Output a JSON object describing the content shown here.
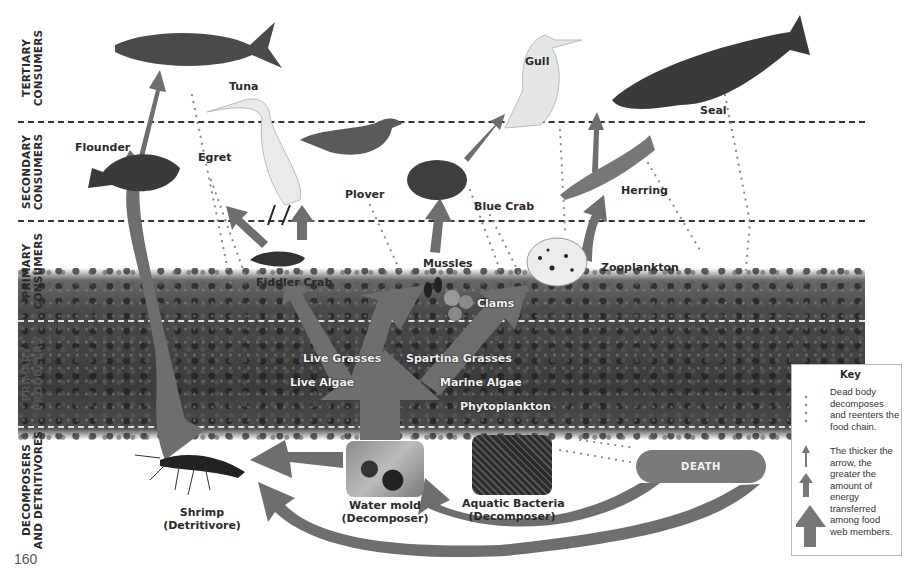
{
  "page_number": "160",
  "bands": [
    {
      "id": "tertiary",
      "label": "TERTIARY\nCONSUMERS"
    },
    {
      "id": "secondary",
      "label": "SECONDARY\nCONSUMERS"
    },
    {
      "id": "primary_consumers",
      "label": "PRIMARY\nCONSUMERS"
    },
    {
      "id": "primary_producers",
      "label": "PRIMARY\nPRODUCERS"
    },
    {
      "id": "decomposers",
      "label": "DECOMPOSERS\nAND DETRITIVORES"
    }
  ],
  "organisms": {
    "tuna": "Tuna",
    "gull": "Gull",
    "seal": "Seal",
    "flounder": "Flounder",
    "egret": "Egret",
    "plover": "Plover",
    "blue_crab": "Blue Crab",
    "herring": "Herring",
    "fiddler_crab": "Fiddler Crab",
    "mussles": "Mussles",
    "clams": "Clams",
    "zooplankton": "Zooplankton",
    "live_grasses": "Live Grasses",
    "spartina_grasses": "Spartina Grasses",
    "live_algae": "Live Algae",
    "marine_algae": "Marine Algae",
    "phytoplankton": "Phytoplankton",
    "shrimp": "Shrimp",
    "shrimp_role": "(Detritivore)",
    "water_mold": "Water mold",
    "water_mold_role": "(Decomposer)",
    "aquatic_bacteria": "Aquatic Bacteria",
    "aquatic_bacteria_role": "(Decomposer)"
  },
  "death_label": "DEATH",
  "key": {
    "title": "Key",
    "dotted_desc": "Dead body decomposes and reenters the food chain.",
    "arrow_desc": "The thicker the arrow, the greater the amount of energy transferred among food web members."
  },
  "colors": {
    "arrow": "#6e6e6e",
    "death_pill": "#7a7a7a",
    "dotted": "#8a8a8a",
    "text": "#2a2a2a"
  }
}
